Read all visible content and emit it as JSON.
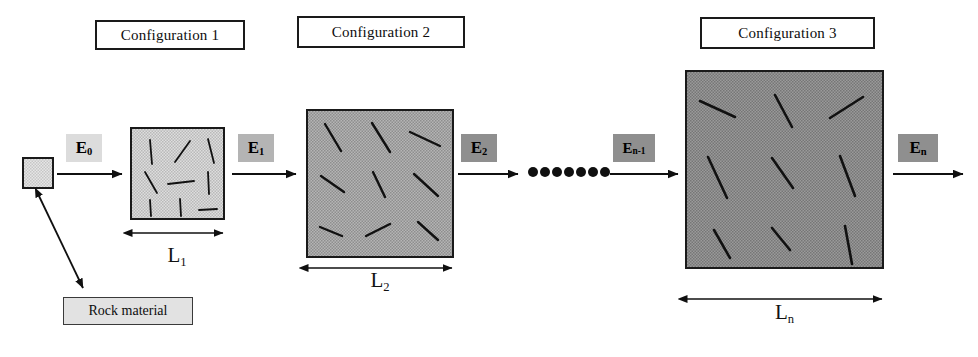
{
  "figure": {
    "caption_boxes": [
      {
        "label": "Configuration 1",
        "x": 95,
        "y": 20,
        "w": 150,
        "h": 30
      },
      {
        "label": "Configuration 2",
        "x": 297,
        "y": 16,
        "w": 168,
        "h": 32
      },
      {
        "label": "Configuration 3",
        "x": 700,
        "y": 17,
        "w": 175,
        "h": 32
      }
    ],
    "rock_material": {
      "label": "Rock material",
      "x": 63,
      "y": 297,
      "w": 130,
      "h": 28
    },
    "seed_block": {
      "name": "rock-sample-square",
      "x": 23,
      "y": 158,
      "w": 30,
      "h": 30
    },
    "energy_labels": [
      {
        "base": "E",
        "sub": "0",
        "text": "E0",
        "x": 66,
        "y": 134,
        "w": 36,
        "h": 28,
        "shade": "light"
      },
      {
        "base": "E",
        "sub": "1",
        "text": "E1",
        "x": 238,
        "y": 134,
        "w": 36,
        "h": 28,
        "shade": "mid"
      },
      {
        "base": "E",
        "sub": "2",
        "text": "E2",
        "x": 461,
        "y": 134,
        "w": 36,
        "h": 28,
        "shade": "dark"
      },
      {
        "base": "E",
        "sub": "n-1",
        "text": "En-1",
        "x": 613,
        "y": 134,
        "w": 42,
        "h": 28,
        "shade": "dark"
      },
      {
        "base": "E",
        "sub": "n",
        "text": "En",
        "x": 898,
        "y": 134,
        "w": 40,
        "h": 28,
        "shade": "dark"
      }
    ],
    "length_labels": [
      {
        "base": "L",
        "sub": "1",
        "text": "L1",
        "x": 128,
        "y": 243,
        "w": 98,
        "h": 26
      },
      {
        "base": "L",
        "sub": "2",
        "text": "L2",
        "x": 305,
        "y": 268,
        "w": 150,
        "h": 28
      },
      {
        "base": "L",
        "sub": "n",
        "text": "Ln",
        "x": 682,
        "y": 300,
        "w": 205,
        "h": 30
      }
    ],
    "blocks": [
      {
        "name": "configuration-1-block",
        "x": 131,
        "y": 128,
        "w": 93,
        "h": 91,
        "fill": "#d6d6d6",
        "fractures": [
          [
            150,
            140,
            152,
            164
          ],
          [
            175,
            162,
            190,
            141
          ],
          [
            208,
            139,
            214,
            163
          ],
          [
            145,
            172,
            157,
            193
          ],
          [
            168,
            184,
            194,
            181
          ],
          [
            208,
            172,
            209,
            194
          ],
          [
            150,
            200,
            151,
            216
          ],
          [
            180,
            199,
            181,
            216
          ],
          [
            199,
            210,
            217,
            209
          ]
        ]
      },
      {
        "name": "configuration-2-block",
        "x": 307,
        "y": 110,
        "w": 146,
        "h": 147,
        "fill": "#a8a8a8",
        "fractures": [
          [
            325,
            124,
            341,
            151
          ],
          [
            372,
            123,
            390,
            152
          ],
          [
            410,
            132,
            440,
            146
          ],
          [
            321,
            176,
            344,
            192
          ],
          [
            373,
            172,
            385,
            197
          ],
          [
            414,
            174,
            438,
            196
          ],
          [
            320,
            227,
            342,
            236
          ],
          [
            366,
            236,
            390,
            224
          ],
          [
            418,
            222,
            438,
            240
          ]
        ]
      },
      {
        "name": "configuration-3-block",
        "x": 686,
        "y": 71,
        "w": 197,
        "h": 197,
        "fill": "#909090",
        "fractures": [
          [
            700,
            101,
            735,
            117
          ],
          [
            775,
            95,
            792,
            127
          ],
          [
            830,
            118,
            863,
            97
          ],
          [
            708,
            157,
            727,
            198
          ],
          [
            772,
            158,
            793,
            188
          ],
          [
            840,
            156,
            855,
            196
          ],
          [
            714,
            230,
            730,
            258
          ],
          [
            772,
            228,
            790,
            250
          ],
          [
            845,
            226,
            852,
            264
          ]
        ]
      }
    ],
    "flow_arrows": [
      {
        "name": "flow-arrow-1",
        "x1": 57,
        "y1": 174,
        "x2": 122,
        "y2": 174
      },
      {
        "name": "flow-arrow-2",
        "x1": 232,
        "y1": 174,
        "x2": 296,
        "y2": 174
      },
      {
        "name": "flow-arrow-3",
        "x1": 458,
        "y1": 174,
        "x2": 518,
        "y2": 174
      },
      {
        "name": "flow-arrow-4",
        "x1": 610,
        "y1": 174,
        "x2": 678,
        "y2": 174
      },
      {
        "name": "flow-arrow-5",
        "x1": 893,
        "y1": 174,
        "x2": 963,
        "y2": 174
      }
    ],
    "ellipsis_dots": {
      "name": "continuation-dots",
      "count": 7,
      "cy": 172,
      "start_x": 533,
      "spacing": 12,
      "r": 5
    },
    "callout_arrow": {
      "name": "rock-material-callout-arrow",
      "x1": 39,
      "y1": 196,
      "x2": 83,
      "y2": 288
    },
    "dim_arrows": [
      {
        "name": "dim-arrow-l1",
        "x1": 132,
        "y1": 233,
        "x2": 223,
        "y2": 233
      },
      {
        "name": "dim-arrow-l2",
        "x1": 308,
        "y1": 268,
        "x2": 452,
        "y2": 268
      },
      {
        "name": "dim-arrow-ln",
        "x1": 687,
        "y1": 299,
        "x2": 882,
        "y2": 299
      }
    ],
    "colors": {
      "stroke": "#1a1a1a",
      "fracture": "#111111",
      "block_fill_1": "#d6d6d6",
      "block_fill_2": "#a8a8a8",
      "block_fill_3": "#909090",
      "seed_fill": "#e0e0e0",
      "rock_box_fill": "#e2e2e2",
      "background": "#ffffff"
    }
  }
}
